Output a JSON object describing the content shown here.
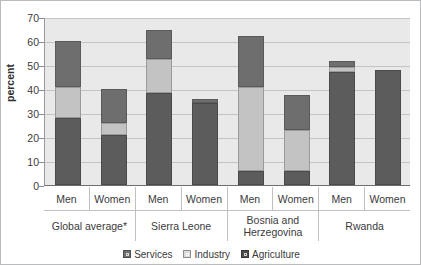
{
  "chart_data": {
    "type": "bar",
    "subtype": "stacked-bar",
    "title": "",
    "xlabel": "",
    "ylabel": "percent",
    "ylim": [
      0,
      70
    ],
    "ytick_step": 10,
    "yticks": [
      70,
      60,
      50,
      40,
      30,
      20,
      10,
      0
    ],
    "grid": true,
    "legend_position": "bottom",
    "stack_order_bottom_up": [
      "Agriculture",
      "Industry",
      "Services"
    ],
    "groups": [
      "Global average*",
      "Sierra Leone",
      "Bosnia and Herzegovina",
      "Rwanda"
    ],
    "subcategories": [
      "Men",
      "Women",
      "Men",
      "Women",
      "Men",
      "Women",
      "Men",
      "Women"
    ],
    "categories": [
      "Global average* Men",
      "Global average* Women",
      "Sierra Leone Men",
      "Sierra Leone Women",
      "Bosnia and Herzegovina Men",
      "Bosnia and Herzegovina Women",
      "Rwanda Men",
      "Rwanda Women"
    ],
    "series": [
      {
        "name": "Agriculture",
        "color": "#5c5c5c",
        "values": [
          28,
          21,
          38.5,
          34,
          6,
          6,
          47,
          48
        ]
      },
      {
        "name": "Industry",
        "color": "#c3c3c3",
        "values": [
          13,
          5,
          14,
          0,
          35,
          17,
          2,
          0
        ]
      },
      {
        "name": "Services",
        "color": "#6e6e6e",
        "values": [
          19,
          14,
          12,
          2,
          21,
          14.5,
          2.5,
          0
        ]
      }
    ],
    "totals": [
      60,
      40,
      64.5,
      36,
      62,
      37.5,
      51.5,
      48
    ]
  },
  "axis": {
    "ylabel": "percent",
    "ytick_labels": [
      "70",
      "60",
      "50",
      "40",
      "30",
      "20",
      "10",
      "0"
    ]
  },
  "xaxis": {
    "sub_labels": [
      "Men",
      "Women",
      "Men",
      "Women",
      "Men",
      "Women",
      "Men",
      "Women"
    ],
    "group_labels": [
      "Global average*",
      "Sierra Leone",
      "Bosnia and Herzegovina",
      "Rwanda"
    ]
  },
  "legend": {
    "items": [
      {
        "label": "Services",
        "color": "#6e6e6e"
      },
      {
        "label": "Industry",
        "color": "#dcdcdc"
      },
      {
        "label": "Agriculture",
        "color": "#4d4d4d"
      }
    ]
  }
}
